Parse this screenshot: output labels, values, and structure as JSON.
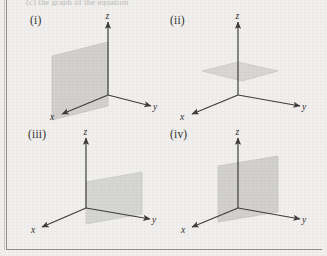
{
  "figure": {
    "clipped_header_text": "(c) the graph of the equation",
    "background_color": "#f1f0ee",
    "plane_fill_color": "#cfcecc",
    "plane_edge_color": "#b8b7b5",
    "axis_color": "#3a3937",
    "rule_color": "#8e8d8b"
  },
  "panels": [
    {
      "id": "i",
      "label": "(i)",
      "description": "vertical plane containing the z-axis, parallel to the xz-plane, shifted toward the viewer",
      "plane_type": "vertical-xz",
      "axes": [
        {
          "name": "z-axis",
          "label": "z"
        },
        {
          "name": "y-axis",
          "label": "y"
        },
        {
          "name": "x-axis",
          "label": "x"
        }
      ]
    },
    {
      "id": "ii",
      "label": "(ii)",
      "description": "horizontal plane parallel to the xy-plane, positioned above the origin",
      "plane_type": "horizontal-xy",
      "axes": [
        {
          "name": "z-axis",
          "label": "z"
        },
        {
          "name": "y-axis",
          "label": "y"
        },
        {
          "name": "x-axis",
          "label": "x"
        }
      ]
    },
    {
      "id": "iii",
      "label": "(iii)",
      "description": "horizontal plane segment occupying the region between the x-axis and y-axis, below the origin",
      "plane_type": "horizontal-quadrant",
      "axes": [
        {
          "name": "z-axis",
          "label": "z"
        },
        {
          "name": "y-axis",
          "label": "y"
        },
        {
          "name": "x-axis",
          "label": "x"
        }
      ]
    },
    {
      "id": "iv",
      "label": "(iv)",
      "description": "vertical plane containing the z-axis, parallel to the yz-plane",
      "plane_type": "vertical-yz",
      "axes": [
        {
          "name": "z-axis",
          "label": "z"
        },
        {
          "name": "y-axis",
          "label": "y"
        },
        {
          "name": "x-axis",
          "label": "x"
        }
      ]
    }
  ]
}
